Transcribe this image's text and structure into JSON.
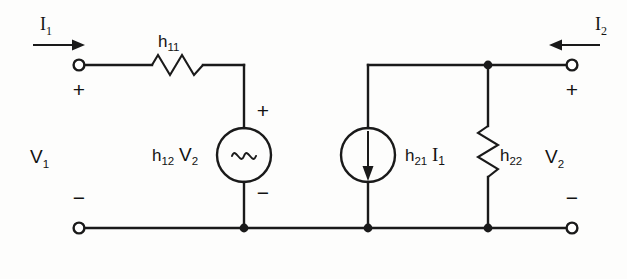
{
  "figure": {
    "name": "h-parameter two-port equivalent circuit",
    "type": "circuit-diagram",
    "background_color": "#fdfdfc",
    "ink_color": "#1a1a1a"
  },
  "ports": {
    "input": {
      "current_label": "I",
      "current_sub": "1",
      "current_arrow_direction": "right",
      "voltage_label": "V",
      "voltage_sub": "1",
      "top_sign": "+",
      "bottom_sign": "−"
    },
    "output": {
      "current_label": "I",
      "current_sub": "2",
      "current_arrow_direction": "left",
      "voltage_label": "V",
      "voltage_sub": "2",
      "top_sign": "+",
      "bottom_sign": "−"
    }
  },
  "components": [
    {
      "id": "h11",
      "kind": "resistor",
      "orientation": "horizontal",
      "label": "h",
      "label_sub": "11"
    },
    {
      "id": "h12v2",
      "kind": "dependent-voltage-source",
      "orientation": "vertical",
      "label_prefix": "h",
      "label_prefix_sub": "12",
      "label_suffix": "V",
      "label_suffix_sub": "2",
      "symbol": "tilde",
      "top_sign": "+",
      "bottom_sign": "−"
    },
    {
      "id": "h21i1",
      "kind": "dependent-current-source",
      "orientation": "vertical",
      "label_prefix": "h",
      "label_prefix_sub": "21",
      "label_suffix": "I",
      "label_suffix_sub": "1",
      "symbol": "down-arrow"
    },
    {
      "id": "h22",
      "kind": "resistor",
      "orientation": "vertical",
      "label": "h",
      "label_sub": "22"
    }
  ]
}
